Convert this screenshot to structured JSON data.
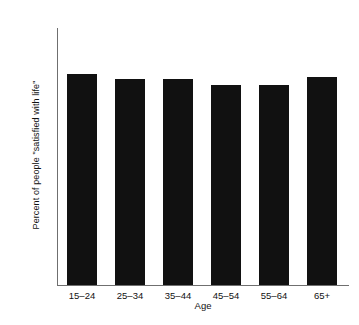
{
  "chart_data": {
    "type": "bar",
    "title": "",
    "categories": [
      "15–24",
      "25–34",
      "35–44",
      "45–54",
      "55–64",
      "65+"
    ],
    "values": [
      82,
      80,
      80,
      78,
      78,
      81
    ],
    "series": [
      {
        "name": "Percent of people \"satisfied with life\"",
        "values": [
          82,
          80,
          80,
          78,
          78,
          81
        ]
      }
    ],
    "xlabel": "Age",
    "ylabel": "Percent of people \"satisfied with life\"",
    "ylim": [
      0,
      100
    ],
    "yticks": [
      10,
      20,
      30,
      40,
      50,
      60,
      70,
      80,
      90,
      100
    ],
    "ytick_labels": [
      "10",
      "20",
      "30",
      "40",
      "50",
      "60",
      "70",
      "80",
      "90",
      "100"
    ],
    "grid": false,
    "legend": false,
    "bar_color": "#111111",
    "axis_color": "#6f6f6f",
    "background": "#ffffff"
  }
}
